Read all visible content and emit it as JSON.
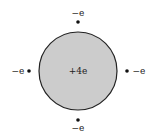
{
  "diagram": {
    "nucleus": {
      "label": "+4e",
      "fill": "#cccccc",
      "stroke": "#222222",
      "cx": 78,
      "cy": 71,
      "r": 39
    },
    "electrons": [
      {
        "position": "top",
        "label": "−e",
        "dot": [
          78,
          22
        ],
        "labelPos": [
          78,
          13
        ]
      },
      {
        "position": "left",
        "label": "−e",
        "dot": [
          29,
          71
        ],
        "labelPos": [
          18,
          71
        ]
      },
      {
        "position": "right",
        "label": "−e",
        "dot": [
          127,
          71
        ],
        "labelPos": [
          139,
          71
        ]
      },
      {
        "position": "bottom",
        "label": "−e",
        "dot": [
          78,
          120
        ],
        "labelPos": [
          78,
          128
        ]
      }
    ]
  }
}
